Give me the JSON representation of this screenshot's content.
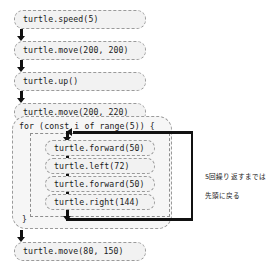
{
  "diagram": {
    "colors": {
      "box_fill": "#f2f2f2",
      "box_border": "#9a9a9a",
      "arrow": "#111111",
      "text": "#1a1a1a",
      "background": "#ffffff"
    },
    "statements": [
      {
        "id": "speed",
        "text": "turtle.speed(5)"
      },
      {
        "id": "move1",
        "text": "turtle.move(200, 200)"
      },
      {
        "id": "up",
        "text": "turtle.up()"
      },
      {
        "id": "move2",
        "text": "turtle.move(200, 220)"
      },
      {
        "id": "down",
        "text": "turtle.down()"
      }
    ],
    "loop": {
      "header": "for (const i of range(5)) {",
      "closing": "}",
      "iterations": 5,
      "body": [
        {
          "id": "forward1",
          "text": "turtle.forward(50)"
        },
        {
          "id": "left",
          "text": "turtle.left(72)"
        },
        {
          "id": "forward2",
          "text": "turtle.forward(50)"
        },
        {
          "id": "right",
          "text": "turtle.right(144)"
        }
      ]
    },
    "after_loop": [
      {
        "id": "move3",
        "text": "turtle.move(80, 150)"
      }
    ],
    "annotation": {
      "line1": "5回繰り返すまでは",
      "line2": "先頭に戻る"
    }
  }
}
